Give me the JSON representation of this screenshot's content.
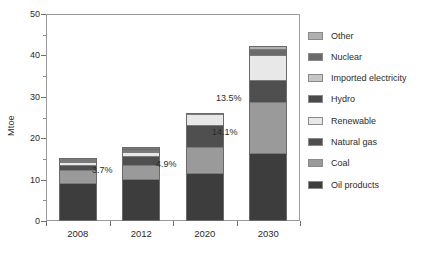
{
  "chart_data": {
    "type": "bar",
    "stacked": true,
    "title": "",
    "subtitle": "",
    "xlabel": "",
    "ylabel": "Mtoe",
    "ylim": [
      0,
      50
    ],
    "yticks": [
      0,
      10,
      20,
      30,
      40,
      50
    ],
    "ytick_labels": [
      "0",
      "10",
      "20",
      "30",
      "40",
      "50"
    ],
    "yminor_ticks": [
      5,
      15,
      25,
      35,
      45
    ],
    "grid": false,
    "legend_position": "right",
    "categories": [
      "2008",
      "2012",
      "2020",
      "2030"
    ],
    "series": [
      {
        "name": "Oil products",
        "color": "#3d3d3d",
        "values": [
          9.2,
          10.2,
          11.5,
          16.5
        ]
      },
      {
        "name": "Coal",
        "color": "#9a9a9a",
        "values": [
          3.1,
          3.3,
          6.4,
          12.3
        ]
      },
      {
        "name": "Natural gas",
        "color": "#4f4f4f",
        "values": [
          1.3,
          2.2,
          5.3,
          5.3
        ]
      },
      {
        "name": "Renewable",
        "color": "#e8e8e8",
        "values": [
          0.55,
          0.9,
          2.6,
          5.9
        ]
      },
      {
        "name": "Hydro",
        "color": "#4a4a4a",
        "values": [
          0.2,
          0.25,
          0.0,
          0.0
        ]
      },
      {
        "name": "Imported electricity",
        "color": "#c6c6c6",
        "values": [
          0.1,
          0.35,
          0.0,
          0.0
        ]
      },
      {
        "name": "Nuclear",
        "color": "#6b6b6b",
        "values": [
          0.3,
          0.45,
          0.0,
          1.6
        ]
      },
      {
        "name": "Other",
        "color": "#b0b0b0",
        "values": [
          0.25,
          0.35,
          0.2,
          0.8
        ]
      }
    ],
    "totals": [
      15.0,
      18.0,
      26.0,
      42.4
    ],
    "annotations": [
      {
        "text": "3.7%",
        "category": "2008"
      },
      {
        "text": "4.9%",
        "category": "2012"
      },
      {
        "text": "14.1%",
        "category": "2020"
      },
      {
        "text": "13.5%",
        "category": "2030"
      }
    ]
  },
  "legend": {
    "items": [
      {
        "label": "Other"
      },
      {
        "label": "Nuclear"
      },
      {
        "label": "Imported electricity"
      },
      {
        "label": "Hydro"
      },
      {
        "label": "Renewable"
      },
      {
        "label": "Natural gas"
      },
      {
        "label": "Coal"
      },
      {
        "label": "Oil products"
      }
    ]
  }
}
